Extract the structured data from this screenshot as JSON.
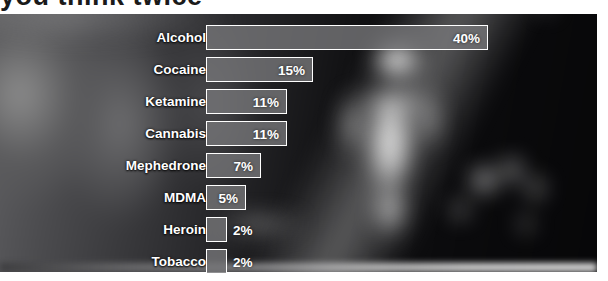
{
  "headline": {
    "cut_text": "you think twice"
  },
  "chart_data": {
    "type": "bar",
    "orientation": "horizontal",
    "title": "",
    "xlabel": "",
    "ylabel": "",
    "unit": "%",
    "grid": false,
    "legend": "none",
    "xlim": [
      0,
      40
    ],
    "categories": [
      "Alcohol",
      "Cocaine",
      "Ketamine",
      "Cannabis",
      "Mephedrone",
      "MDMA",
      "Heroin",
      "Tobacco"
    ],
    "values": [
      40,
      15,
      11,
      11,
      7,
      5,
      2,
      2
    ],
    "value_labels": [
      "40%",
      "15%",
      "11%",
      "11%",
      "7%",
      "5%",
      "2%",
      "2%"
    ],
    "label_placement": [
      "inside",
      "inside",
      "inside",
      "inside",
      "inside",
      "inside",
      "outside",
      "outside"
    ]
  },
  "rows": [
    {
      "label": "Alcohol",
      "value_label": "40%",
      "value": 40,
      "width_px": 282,
      "top_px": 10,
      "placement": "inside"
    },
    {
      "label": "Cocaine",
      "value_label": "15%",
      "value": 15,
      "width_px": 107,
      "top_px": 42,
      "placement": "inside"
    },
    {
      "label": "Ketamine",
      "value_label": "11%",
      "value": 11,
      "width_px": 81,
      "top_px": 74,
      "placement": "inside"
    },
    {
      "label": "Cannabis",
      "value_label": "11%",
      "value": 11,
      "width_px": 81,
      "top_px": 106,
      "placement": "inside"
    },
    {
      "label": "Mephedrone",
      "value_label": "7%",
      "value": 7,
      "width_px": 55,
      "top_px": 138,
      "placement": "inside"
    },
    {
      "label": "MDMA",
      "value_label": "5%",
      "value": 5,
      "width_px": 40,
      "top_px": 170,
      "placement": "inside"
    },
    {
      "label": "Heroin",
      "value_label": "2%",
      "value": 2,
      "width_px": 21,
      "top_px": 202,
      "placement": "outside"
    },
    {
      "label": "Tobacco",
      "value_label": "2%",
      "value": 2,
      "width_px": 21,
      "top_px": 234,
      "placement": "outside"
    }
  ],
  "colors": {
    "bar_fill": "#767678",
    "bar_border": "#ffffff",
    "label_text": "#ffffff",
    "page_background": "#ffffff",
    "photo_background": "#0d0d0f"
  }
}
